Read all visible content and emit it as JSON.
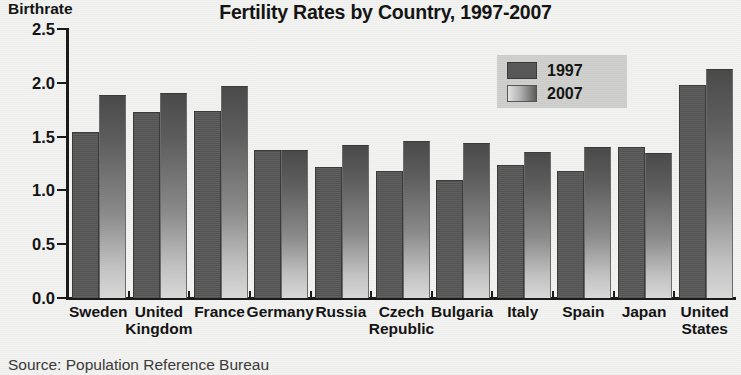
{
  "chart_data": {
    "type": "bar",
    "title": "Fertility Rates by Country, 1997-2007",
    "xlabel": "",
    "ylabel": "Birthrate",
    "ylim": [
      0.0,
      2.5
    ],
    "ytick_labels": [
      "0.0",
      "0.5",
      "1.0",
      "1.5",
      "2.0",
      "2.5"
    ],
    "ytick_values": [
      0.0,
      0.5,
      1.0,
      1.5,
      2.0,
      2.5
    ],
    "grid": false,
    "legend_position": "upper-right-inside",
    "categories": [
      "Sweden",
      "United Kingdom",
      "France",
      "Germany",
      "Russia",
      "Czech Republic",
      "Bulgaria",
      "Italy",
      "Spain",
      "Japan",
      "United States"
    ],
    "category_lines": [
      [
        "Sweden",
        ""
      ],
      [
        "United",
        "Kingdom"
      ],
      [
        "France",
        ""
      ],
      [
        "Germany",
        ""
      ],
      [
        "Russia",
        ""
      ],
      [
        "Czech",
        "Republic"
      ],
      [
        "Bulgaria",
        ""
      ],
      [
        "Italy",
        ""
      ],
      [
        "Spain",
        ""
      ],
      [
        "Japan",
        ""
      ],
      [
        "United",
        "States"
      ]
    ],
    "series": [
      {
        "name": "1997",
        "color": "#575757",
        "values": [
          1.53,
          1.72,
          1.73,
          1.37,
          1.21,
          1.17,
          1.09,
          1.23,
          1.17,
          1.39,
          1.97
        ]
      },
      {
        "name": "2007",
        "color": "#9a9a9a",
        "values": [
          1.88,
          1.9,
          1.96,
          1.37,
          1.41,
          1.45,
          1.43,
          1.35,
          1.39,
          1.34,
          2.12
        ]
      }
    ],
    "source": "Source: Population Reference Bureau"
  }
}
